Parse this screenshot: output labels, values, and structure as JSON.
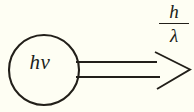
{
  "figure": {
    "name": "photon-momentum-diagram",
    "background_color": "#fefef3",
    "ink_color": "#221f19"
  },
  "photon": {
    "energy_label": "hν",
    "circle": {
      "center_x": 44,
      "center_y": 70,
      "radius": 35,
      "stroke_width": 2.0
    }
  },
  "arrow": {
    "name": "momentum-arrow",
    "style": "open-outline",
    "shaft_top_y": 62,
    "shaft_bottom_y": 77,
    "shaft_start_x": 76,
    "head_start_x": 156,
    "tip_x": 190,
    "tip_y": 69.5,
    "stroke_width": 1.8
  },
  "momentum_label": {
    "name": "momentum-fraction",
    "numerator": "h",
    "denominator": "λ",
    "full_text": "h/λ"
  }
}
